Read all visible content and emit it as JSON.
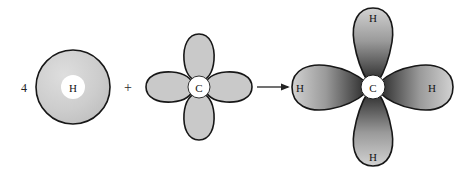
{
  "figure": {
    "background_color": "#ffffff",
    "reaction_type": "orbital-overlap-diagram",
    "description_terms": {
      "reactant_coefficient": "4",
      "plus_operator": "+",
      "arrow_glyph": "→"
    }
  },
  "reactants": {
    "hydrogen": {
      "coefficient": "4",
      "label": "H",
      "orbital_kind": "1s",
      "shape": "sphere",
      "fill_color": "#cfcfcf",
      "outline_color": "#171717",
      "core_color": "#ffffff",
      "center_x": 73,
      "center_y": 87,
      "radius": 37,
      "core_radius": 12
    },
    "operator": {
      "symbol": "+",
      "x": 128,
      "y": 87
    },
    "carbon": {
      "label": "C",
      "orbital_kind": "sp3",
      "shape": "four-lobe-cross",
      "lobe_count": 4,
      "fill_color": "#c9c9c9",
      "outline_color": "#171717",
      "core_color": "#ffffff",
      "center_x": 199,
      "center_y": 87,
      "lobe_length": 56,
      "lobe_width": 27,
      "core_radius": 11,
      "lobe_labels": [
        "",
        "",
        "",
        ""
      ]
    }
  },
  "arrow": {
    "symbol": "→",
    "x_start": 257,
    "x_end": 289,
    "y": 87,
    "color": "#242424"
  },
  "product": {
    "center_label": "C",
    "molecule_hint": "CH4",
    "core_color": "#ffffff",
    "outline_color": "#171717",
    "center_x": 373,
    "center_y": 87,
    "core_radius": 12,
    "gradient": {
      "tip_color": "#d2d2d2",
      "mid_color": "#8a8a8a",
      "base_color": "#2a2a2a"
    },
    "bonds": [
      {
        "label": "H",
        "direction": "up",
        "label_x": 373,
        "label_y": 17,
        "length": 79,
        "width": 30
      },
      {
        "label": "H",
        "direction": "left",
        "label_x": 300,
        "label_y": 88,
        "length": 81,
        "width": 30
      },
      {
        "label": "H",
        "direction": "right",
        "label_x": 432,
        "label_y": 88,
        "length": 79,
        "width": 30
      },
      {
        "label": "H",
        "direction": "down",
        "label_x": 373,
        "label_y": 157,
        "length": 73,
        "width": 30
      }
    ]
  }
}
